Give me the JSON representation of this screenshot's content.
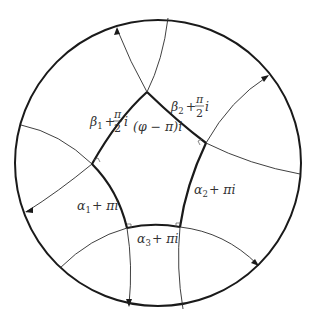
{
  "figure": {
    "labels": {
      "beta1": {
        "base": "β",
        "sub": "1",
        "plus": "+",
        "num": "π",
        "den": "2",
        "suffix": "i"
      },
      "beta2": {
        "base": "β",
        "sub": "2",
        "plus": "+",
        "num": "π",
        "den": "2",
        "suffix": "i"
      },
      "phi": "(φ − π)i",
      "alpha1": {
        "base": "α",
        "sub": "1",
        "rest": "+ πi"
      },
      "alpha2": {
        "base": "α",
        "sub": "2",
        "rest": "+ πi"
      },
      "alpha3": {
        "base": "α",
        "sub": "3",
        "rest": "+ πi"
      }
    },
    "colors": {
      "stroke": "#1a1a1a",
      "text": "#333333",
      "background": "#ffffff"
    },
    "disk": {
      "cx": 158,
      "cy": 163,
      "r": 143
    }
  }
}
